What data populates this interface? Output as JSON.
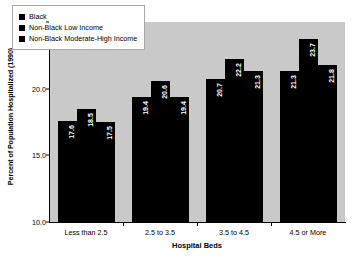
{
  "chart_data": {
    "type": "bar",
    "title": "",
    "xlabel": "Hospital Beds",
    "ylabel": "Percent of Population Hospitalized (1990)",
    "categories": [
      "Less than 2.5",
      "2.5 to 3.5",
      "3.5 to 4.5",
      "4.5 or More"
    ],
    "series": [
      {
        "name": "Black",
        "color": "#000000",
        "values": [
          17.6,
          19.4,
          20.7,
          21.3
        ]
      },
      {
        "name": "Non-Black Low Income",
        "color": "#000000",
        "values": [
          18.5,
          20.6,
          22.2,
          23.7
        ]
      },
      {
        "name": "Non-Black Moderate-High Income",
        "color": "#000000",
        "values": [
          17.5,
          19.4,
          21.3,
          21.8
        ]
      }
    ],
    "ylim": [
      10.0,
      25.0
    ],
    "yticks": [
      "10.0",
      "15.0",
      "20.0",
      "25.0"
    ],
    "ytick_values": [
      10.0,
      15.0,
      20.0,
      25.0
    ],
    "grid": false,
    "legend_position": "upper-left-inside",
    "plot_background": "#c9c9c9",
    "figure_background": "#ffffff",
    "data_label_color": "#ffffff",
    "bar_labels": [
      [
        "17.6",
        "18.5",
        "17.5"
      ],
      [
        "19.4",
        "20.6",
        "19.4"
      ],
      [
        "20.7",
        "22.2",
        "21.3"
      ],
      [
        "21.3",
        "23.7",
        "21.8"
      ]
    ]
  }
}
